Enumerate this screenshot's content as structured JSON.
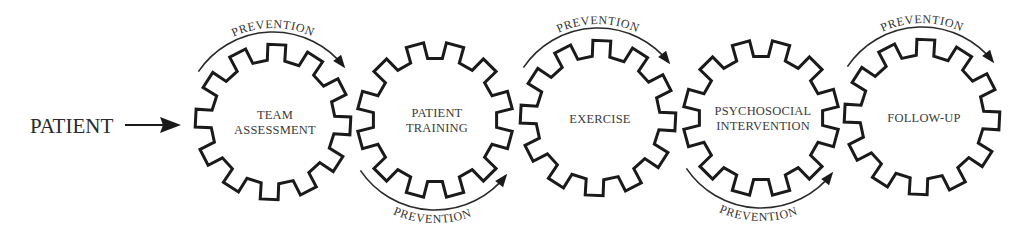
{
  "diagram": {
    "entry": {
      "label": "PATIENT"
    },
    "gears": [
      {
        "id": "team-assessment",
        "lines": [
          "TEAM",
          "ASSESSMENT"
        ],
        "cx": 273,
        "cy": 122,
        "prevention": "top"
      },
      {
        "id": "patient-training",
        "lines": [
          "PATIENT",
          "TRAINING"
        ],
        "cx": 435,
        "cy": 120,
        "prevention": "bottom"
      },
      {
        "id": "exercise",
        "lines": [
          "EXERCISE"
        ],
        "cx": 598,
        "cy": 118,
        "prevention": "top"
      },
      {
        "id": "psychosocial-intervention",
        "lines": [
          "PSYCHOSOCIAL",
          "INTERVENTION"
        ],
        "cx": 761,
        "cy": 118,
        "prevention": "bottom"
      },
      {
        "id": "follow-up",
        "lines": [
          "FOLLOW-UP"
        ],
        "cx": 922,
        "cy": 117,
        "prevention": "top"
      }
    ],
    "prevention_label": "PREVENTION",
    "colors": {
      "stroke": "#1a1a1a",
      "text": "#333333",
      "background": "#ffffff"
    }
  }
}
